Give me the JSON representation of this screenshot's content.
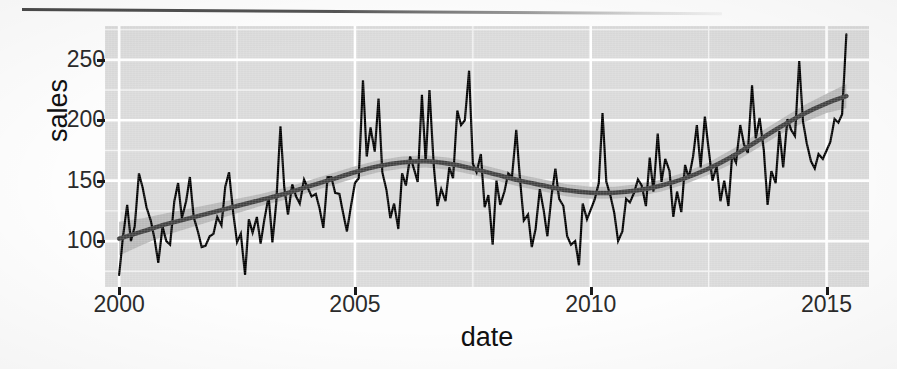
{
  "figure": {
    "title": "",
    "x_axis_label": "date",
    "y_axis_label": "sales",
    "page_rule": "horizontal-rule"
  },
  "chart_data": {
    "type": "line",
    "title": "",
    "xlabel": "date",
    "ylabel": "sales",
    "xlim": [
      1999.7,
      2015.9
    ],
    "ylim": [
      62,
      278
    ],
    "xticks": [
      2000,
      2005,
      2010,
      2015
    ],
    "yticks": [
      100,
      150,
      200,
      250
    ],
    "xtick_labels": [
      "2000",
      "2005",
      "2010",
      "2015"
    ],
    "ytick_labels": [
      "100",
      "150",
      "200",
      "250"
    ],
    "grid": true,
    "grid_major_color": "#ffffff",
    "grid_minor_color": "#f2f2f2",
    "panel_background": "#d9d9d9",
    "legend": "none",
    "series": [
      {
        "name": "sales",
        "type": "line",
        "color": "#000000",
        "linewidth": 2.2,
        "x": [
          2000.0,
          2000.08,
          2000.17,
          2000.25,
          2000.33,
          2000.42,
          2000.5,
          2000.58,
          2000.67,
          2000.75,
          2000.83,
          2000.92,
          2001.0,
          2001.08,
          2001.17,
          2001.25,
          2001.33,
          2001.42,
          2001.5,
          2001.58,
          2001.67,
          2001.75,
          2001.83,
          2001.92,
          2002.0,
          2002.08,
          2002.17,
          2002.25,
          2002.33,
          2002.42,
          2002.5,
          2002.58,
          2002.67,
          2002.75,
          2002.83,
          2002.92,
          2003.0,
          2003.08,
          2003.17,
          2003.25,
          2003.33,
          2003.42,
          2003.5,
          2003.58,
          2003.67,
          2003.75,
          2003.83,
          2003.92,
          2004.0,
          2004.08,
          2004.17,
          2004.25,
          2004.33,
          2004.42,
          2004.5,
          2004.58,
          2004.67,
          2004.75,
          2004.83,
          2004.92,
          2005.0,
          2005.08,
          2005.17,
          2005.25,
          2005.33,
          2005.42,
          2005.5,
          2005.58,
          2005.67,
          2005.75,
          2005.83,
          2005.92,
          2006.0,
          2006.08,
          2006.17,
          2006.25,
          2006.33,
          2006.42,
          2006.5,
          2006.58,
          2006.67,
          2006.75,
          2006.83,
          2006.92,
          2007.0,
          2007.08,
          2007.17,
          2007.25,
          2007.33,
          2007.42,
          2007.5,
          2007.58,
          2007.67,
          2007.75,
          2007.83,
          2007.92,
          2008.0,
          2008.08,
          2008.17,
          2008.25,
          2008.33,
          2008.42,
          2008.5,
          2008.58,
          2008.67,
          2008.75,
          2008.83,
          2008.92,
          2009.0,
          2009.08,
          2009.17,
          2009.25,
          2009.33,
          2009.42,
          2009.5,
          2009.58,
          2009.67,
          2009.75,
          2009.83,
          2009.92,
          2010.0,
          2010.08,
          2010.17,
          2010.25,
          2010.33,
          2010.42,
          2010.5,
          2010.58,
          2010.67,
          2010.75,
          2010.83,
          2010.92,
          2011.0,
          2011.08,
          2011.17,
          2011.25,
          2011.33,
          2011.42,
          2011.5,
          2011.58,
          2011.67,
          2011.75,
          2011.83,
          2011.92,
          2012.0,
          2012.08,
          2012.17,
          2012.25,
          2012.33,
          2012.42,
          2012.5,
          2012.58,
          2012.67,
          2012.75,
          2012.83,
          2012.92,
          2013.0,
          2013.08,
          2013.17,
          2013.25,
          2013.33,
          2013.42,
          2013.5,
          2013.58,
          2013.67,
          2013.75,
          2013.83,
          2013.92,
          2014.0,
          2014.08,
          2014.17,
          2014.25,
          2014.33,
          2014.42,
          2014.5,
          2014.58,
          2014.67,
          2014.75,
          2014.83,
          2014.92,
          2015.0,
          2015.08,
          2015.17,
          2015.25,
          2015.33,
          2015.42
        ],
        "y": [
          72,
          103,
          130,
          100,
          112,
          156,
          144,
          128,
          117,
          102,
          82,
          112,
          100,
          97,
          133,
          148,
          119,
          133,
          153,
          120,
          108,
          95,
          96,
          104,
          106,
          120,
          113,
          145,
          157,
          123,
          99,
          106,
          72,
          118,
          107,
          120,
          98,
          118,
          137,
          99,
          131,
          195,
          145,
          122,
          147,
          137,
          131,
          151,
          144,
          137,
          139,
          127,
          111,
          153,
          153,
          140,
          139,
          123,
          108,
          130,
          148,
          152,
          233,
          170,
          194,
          174,
          218,
          157,
          142,
          119,
          131,
          110,
          156,
          146,
          170,
          160,
          149,
          221,
          165,
          225,
          163,
          129,
          143,
          133,
          161,
          152,
          208,
          196,
          200,
          241,
          164,
          157,
          172,
          128,
          138,
          97,
          150,
          130,
          141,
          156,
          153,
          192,
          151,
          117,
          122,
          95,
          110,
          143,
          126,
          104,
          138,
          160,
          135,
          129,
          104,
          97,
          100,
          80,
          131,
          118,
          126,
          134,
          148,
          206,
          149,
          137,
          123,
          100,
          108,
          135,
          132,
          140,
          151,
          146,
          129,
          169,
          141,
          189,
          149,
          168,
          158,
          120,
          141,
          124,
          163,
          152,
          170,
          196,
          161,
          203,
          176,
          150,
          162,
          133,
          150,
          129,
          172,
          165,
          196,
          180,
          173,
          229,
          185,
          202,
          175,
          130,
          158,
          148,
          191,
          161,
          201,
          192,
          187,
          249,
          199,
          181,
          166,
          160,
          172,
          168,
          175,
          182,
          201,
          198,
          205,
          271
        ]
      },
      {
        "name": "loess smooth",
        "type": "line",
        "color": "#3f3f3f",
        "linewidth": 4.5,
        "x": [
          2000.0,
          2000.5,
          2001.0,
          2001.5,
          2002.0,
          2002.5,
          2003.0,
          2003.5,
          2004.0,
          2004.5,
          2005.0,
          2005.5,
          2006.0,
          2006.5,
          2007.0,
          2007.5,
          2008.0,
          2008.5,
          2009.0,
          2009.5,
          2010.0,
          2010.5,
          2011.0,
          2011.5,
          2012.0,
          2012.5,
          2013.0,
          2013.5,
          2014.0,
          2014.5,
          2015.0,
          2015.42
        ],
        "y": [
          102,
          108,
          114,
          119,
          124,
          129,
          134,
          139,
          145,
          151,
          157,
          162,
          165,
          166,
          164,
          160,
          155,
          150,
          146,
          142,
          140,
          140,
          142,
          146,
          152,
          160,
          170,
          182,
          194,
          205,
          214,
          220
        ]
      },
      {
        "name": "confidence ribbon",
        "type": "area",
        "color": "#b0b0b0",
        "x": [
          2000.0,
          2000.5,
          2001.0,
          2001.5,
          2002.0,
          2002.5,
          2003.0,
          2003.5,
          2004.0,
          2004.5,
          2005.0,
          2005.5,
          2006.0,
          2006.5,
          2007.0,
          2007.5,
          2008.0,
          2008.5,
          2009.0,
          2009.5,
          2010.0,
          2010.5,
          2011.0,
          2011.5,
          2012.0,
          2012.5,
          2013.0,
          2013.5,
          2014.0,
          2014.5,
          2015.0,
          2015.42
        ],
        "ymin": [
          88,
          97,
          105,
          111,
          117,
          123,
          129,
          134,
          140,
          146,
          152,
          157,
          160,
          161,
          159,
          155,
          150,
          145,
          141,
          137,
          135,
          135,
          137,
          141,
          147,
          155,
          164,
          176,
          188,
          198,
          206,
          210
        ],
        "ymax": [
          116,
          119,
          123,
          127,
          131,
          135,
          139,
          144,
          150,
          156,
          162,
          167,
          170,
          171,
          169,
          165,
          160,
          155,
          151,
          147,
          145,
          145,
          147,
          151,
          157,
          165,
          176,
          188,
          200,
          212,
          222,
          230
        ]
      }
    ]
  }
}
